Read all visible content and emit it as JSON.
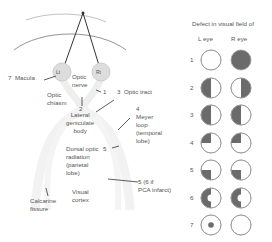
{
  "pathway": {
    "eyes": {
      "left": "Lt",
      "right": "Rt"
    },
    "labels": {
      "macula": "7  Macula",
      "optic_nerve": "Optic\nnerve",
      "optic_chiasm": "Optic\nchiasm",
      "num1": "1",
      "optic_tract": "3  Optic tract",
      "num2": "2",
      "lgb": "Lateral\ngeniculate\nbody",
      "meyer": "4\nMeyer\nloop\n(temporal\nlobe)",
      "dorsal": "Dorsal optic\nradiation\n(parietal\nlobe)",
      "num5": "5",
      "pca": "5 (6 if\nPCA infarct)",
      "visual_cortex": "Visual\ncortex",
      "calcarine": "Calcarine\nfissure"
    }
  },
  "defects": {
    "title": "Defect in visual field of",
    "col_left": "L eye",
    "col_right": "R eye",
    "rows": [
      {
        "n": "1",
        "left": "none",
        "right": "full"
      },
      {
        "n": "2",
        "left": "left-half",
        "right": "right-half"
      },
      {
        "n": "3",
        "left": "left-half",
        "right": "left-half"
      },
      {
        "n": "4",
        "left": "upper-left-quadrant",
        "right": "upper-left-quadrant"
      },
      {
        "n": "5",
        "left": "lower-left-quadrant",
        "right": "lower-left-quadrant"
      },
      {
        "n": "6",
        "left": "left-half-macular-sparing",
        "right": "left-half-macular-sparing"
      },
      {
        "n": "7",
        "left": "central-scotoma",
        "right": "none"
      }
    ]
  },
  "colors": {
    "fill": "#6b6b6b",
    "outline": "#9a9a9a",
    "pathway": "#eeeeee"
  }
}
